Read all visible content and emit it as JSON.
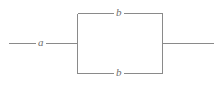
{
  "diagram": {
    "background_color": "#ffffff",
    "line_color": "#8a8a8a",
    "label_color": "#6f6f6f",
    "labels": {
      "series_element": "a",
      "parallel_top": "b",
      "parallel_bottom": "b"
    },
    "geometry": {
      "left_lead_start_x": 8,
      "left_lead_end_x": 77,
      "right_lead_start_x": 162,
      "right_lead_end_x": 213,
      "mid_y": 43,
      "box_left_x": 77,
      "box_right_x": 162,
      "box_top_y": 13,
      "box_bottom_y": 73
    }
  }
}
